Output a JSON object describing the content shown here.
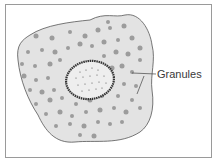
{
  "diagram": {
    "labels": [
      {
        "text": "Granules",
        "points_to": [
          "granule",
          "granule"
        ]
      }
    ],
    "colors": {
      "border": "#9a9a9a",
      "cytoplasm": "#e3e3e3",
      "cell_outline": "#555555",
      "granule": "#9c9c9c",
      "nucleus_fill": "#eeeeee",
      "nucleus_border": "#333333",
      "label_text": "#3a3a3a"
    },
    "parts": [
      "cell-membrane",
      "cytoplasm",
      "granules",
      "nucleus"
    ]
  }
}
